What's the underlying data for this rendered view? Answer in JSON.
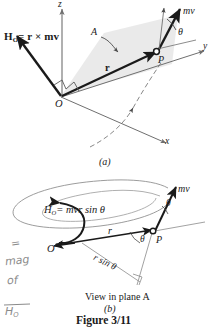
{
  "figure": {
    "caption": "Figure 3/11",
    "panel_a_label": "(a)",
    "panel_b_label": "(b)",
    "panel_b_subtitle": "View in plane A"
  },
  "colors": {
    "ink": "#1a1a1a",
    "axis": "#4a4a4a",
    "plane_fill": "#e9e9e9",
    "pencil": "#8b8b8b",
    "spiral": "#777777"
  },
  "panel_a": {
    "moment_label_H": "H",
    "moment_label_sub": "O",
    "moment_label_rest": "= r × mv",
    "axis_z": "z",
    "axis_y": "y",
    "axis_x": "x",
    "origin": "O",
    "point_p": "P",
    "plane_label": "A",
    "vector_r": "r",
    "vector_mv": "mv",
    "angle_theta": "θ"
  },
  "panel_b": {
    "formula_H": "H",
    "formula_sub": "O",
    "formula_rest": "= mvr sin θ",
    "origin": "O",
    "point_p": "P",
    "vector_r": "r",
    "vector_mv": "mv",
    "angle_theta_at_p": "θ",
    "angle_theta_upper": "θ",
    "moment_arm": "r sin θ"
  },
  "annotations": {
    "line1": "=",
    "line2": "mag",
    "line3": "of",
    "line4": "H",
    "line4_sub": "O"
  }
}
